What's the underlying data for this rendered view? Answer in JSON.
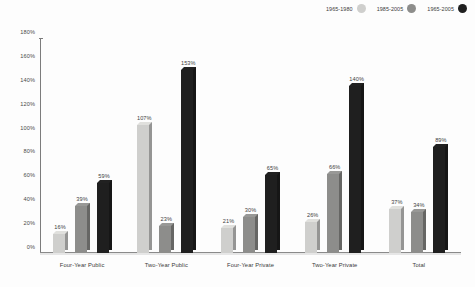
{
  "chart_data": {
    "type": "bar",
    "title": "",
    "xlabel": "",
    "ylabel": "",
    "ylim": [
      0,
      180
    ],
    "ytick_step": 20,
    "grid": false,
    "legend_position": "top-right",
    "categories": [
      "Four-Year Public",
      "Two-Year Public",
      "Four-Year Private",
      "Two-Year Private",
      "Total"
    ],
    "ytick_labels": [
      "0%",
      "20%",
      "40%",
      "60%",
      "80%",
      "100%",
      "120%",
      "140%",
      "160%",
      "180%"
    ],
    "series": [
      {
        "name": "1965-1980",
        "color": "#cfcfcd",
        "values": [
          16,
          107,
          21,
          26,
          37
        ],
        "value_labels": [
          "16%",
          "107%",
          "21%",
          "26%",
          "37%"
        ]
      },
      {
        "name": "1985-2005",
        "color": "#8d8d8b",
        "values": [
          39,
          23,
          30,
          66,
          34
        ],
        "value_labels": [
          "39%",
          "23%",
          "30%",
          "66%",
          "34%"
        ]
      },
      {
        "name": "1965-2005",
        "color": "#1f1f1f",
        "values": [
          59,
          153,
          65,
          140,
          89
        ],
        "value_labels": [
          "59%",
          "153%",
          "65%",
          "140%",
          "89%"
        ]
      }
    ]
  }
}
